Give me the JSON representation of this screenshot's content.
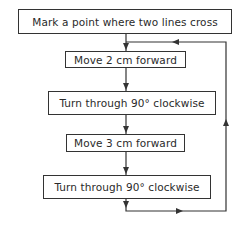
{
  "flowchart": {
    "steps": [
      {
        "label": "Mark a point where two lines cross"
      },
      {
        "label": "Move 2 cm forward"
      },
      {
        "label": "Turn through 90° clockwise"
      },
      {
        "label": "Move 3 cm forward"
      },
      {
        "label": "Turn through 90° clockwise"
      }
    ],
    "loop": {
      "from_step": 5,
      "to_step": 2,
      "description": "repeat loop back to Move 2 cm forward"
    }
  },
  "colors": {
    "line": "#333333",
    "text": "#2a2a2a",
    "background": "#ffffff"
  }
}
